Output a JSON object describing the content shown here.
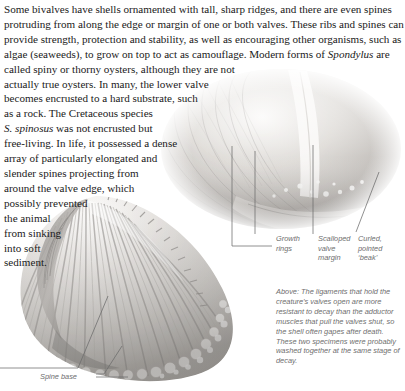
{
  "page": {
    "width": 405,
    "height": 391,
    "background": "#ffffff",
    "body_text_color": "#1a1a1a",
    "annotation_color": "#6e6e6e",
    "leader_line_color": "#6b6b6b"
  },
  "body": {
    "lines": [
      "Some bivalves have shells ornamented with tall, sharp ridges, and there are even spines",
      "protruding from along the edge or margin of one or both valves. These ribs and spines can",
      "provide strength, protection and stability, as well as encouraging other organisms, such as",
      "algae (seaweeds), to grow on top to act as camouflage. Modern forms of ",
      "called spiny or thorny oysters, although they are not",
      "actually true oysters. In many, the lower valve",
      "becomes encrusted to a hard substrate, such",
      "as a rock. The Cretaceous species",
      "was not encrusted but",
      "free-living. In life, it possessed a dense",
      "array of particularly elongated and",
      "slender spines projecting from",
      "around the valve edge, which",
      "possibly prevented",
      "the animal",
      "from sinking",
      "into soft",
      "sediment."
    ],
    "italic_genus": "Spondylus",
    "trailing_after_genus": " are",
    "italic_species_abbrev": "S. ",
    "italic_species": "spinosus",
    "species_line_tail": " was not encrusted but"
  },
  "annotations": [
    {
      "id": "growth-rings",
      "text": "Growth\nrings"
    },
    {
      "id": "scalloped-margin",
      "text": "Scalloped\nvalve\nmargin"
    },
    {
      "id": "curled-beak",
      "text": "Curled,\npointed\n‘beak’"
    },
    {
      "id": "spine-base",
      "text": "Spine base"
    }
  ],
  "caption": {
    "lead": "Above:",
    "text": " The ligaments that hold the creature’s valves open are more resistant to decay than the adductor muscles that pull the valves shut, so the shell often gapes after death. These two specimens were probably washed together at the same stage of decay."
  },
  "photo": {
    "alt_upper": "upper-bivalve-shell-specimen",
    "alt_lower": "lower-fan-shaped-bivalve-shell-specimen",
    "palette": {
      "shell_light": "#f2f0ee",
      "shell_mid": "#c9c6c2",
      "shell_dark": "#8e8b88",
      "shell_shadow": "#6a6765"
    }
  }
}
